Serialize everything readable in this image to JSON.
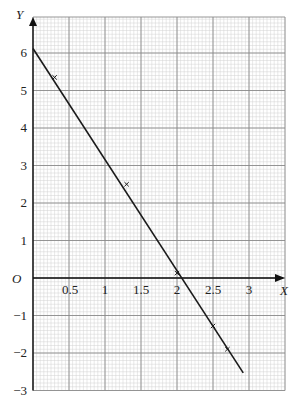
{
  "chart_data": {
    "type": "line",
    "title": "",
    "xlabel": "X",
    "ylabel": "Y",
    "origin_label": "O",
    "xlim": [
      0,
      3.5
    ],
    "ylim": [
      -3,
      7
    ],
    "grid": true,
    "x_ticks": [
      "0.5",
      "1",
      "1.5",
      "2",
      "2.5",
      "3"
    ],
    "x_tick_values": [
      0.5,
      1,
      1.5,
      2,
      2.5,
      3
    ],
    "y_ticks": [
      "6",
      "5",
      "4",
      "3",
      "2",
      "1",
      "-1",
      "-2",
      "-3"
    ],
    "y_tick_values": [
      6,
      5,
      4,
      3,
      2,
      1,
      -1,
      -2,
      -3
    ],
    "series": [
      {
        "name": "plotted points",
        "kind": "scatter",
        "marker": "x",
        "x": [
          0.3,
          1.3,
          2.0,
          2.5,
          2.7
        ],
        "y": [
          5.35,
          2.5,
          0.13,
          -1.28,
          -1.9
        ]
      },
      {
        "name": "line of best fit",
        "kind": "line",
        "x": [
          0,
          2.92
        ],
        "y": [
          6.12,
          -2.53
        ]
      }
    ],
    "colors": {
      "line": "#1a1a1a",
      "major_grid": "#8a8a8a",
      "minor_grid": "#d2d2d2",
      "axis": "#111111"
    }
  }
}
